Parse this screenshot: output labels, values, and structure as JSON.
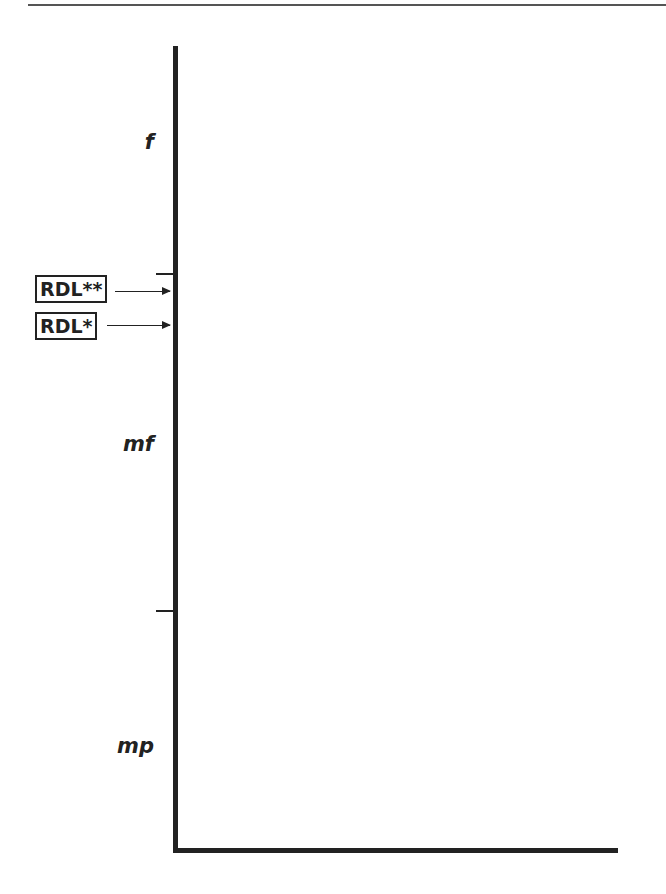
{
  "diagram": {
    "zones": [
      {
        "label": "f"
      },
      {
        "label": "mf"
      },
      {
        "label": "mp"
      }
    ],
    "markers": [
      {
        "label": "RDL**"
      },
      {
        "label": "RDL*"
      }
    ],
    "colors": {
      "line": "#222222",
      "background": "#ffffff"
    }
  }
}
